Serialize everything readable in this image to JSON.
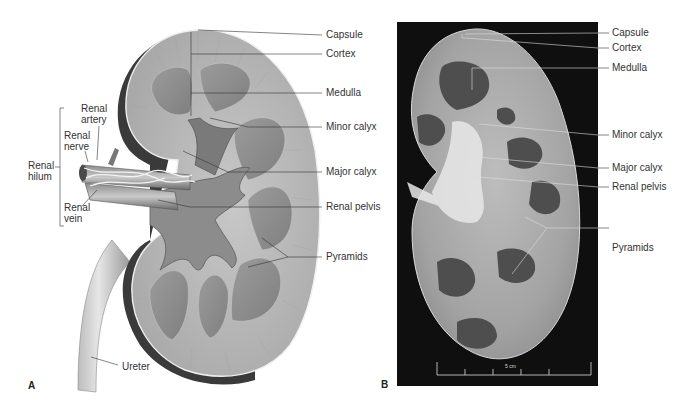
{
  "panel_a": {
    "letter": "A",
    "labels": {
      "capsule": "Capsule",
      "cortex": "Cortex",
      "medulla": "Medulla",
      "minor_calyx": "Minor calyx",
      "major_calyx": "Major calyx",
      "renal_pelvis": "Renal pelvis",
      "pyramids": "Pyramids",
      "ureter": "Ureter",
      "renal_artery_1": "Renal",
      "renal_artery_2": "artery",
      "renal_nerve_1": "Renal",
      "renal_nerve_2": "nerve",
      "renal_hilum_1": "Renal",
      "renal_hilum_2": "hilum",
      "renal_vein_1": "Renal",
      "renal_vein_2": "vein"
    }
  },
  "panel_b": {
    "letter": "B",
    "labels": {
      "capsule": "Capsule",
      "cortex": "Cortex",
      "medulla": "Medulla",
      "minor_calyx": "Minor calyx",
      "major_calyx": "Major calyx",
      "renal_pelvis": "Renal pelvis",
      "pyramids": "Pyramids"
    },
    "scale_bar": "5 cm"
  },
  "colors": {
    "background": "#ffffff",
    "photo_background": "#0f0f0f",
    "kidney_capsule_dark": "#3a3a3a",
    "kidney_cortex": "#b9b9b9",
    "kidney_pyramid": "#8e8e8e",
    "label_text": "#333333"
  }
}
